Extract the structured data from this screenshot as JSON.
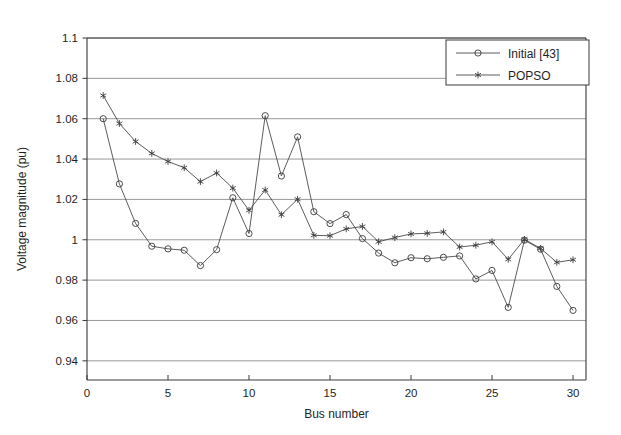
{
  "chart_data": {
    "type": "line",
    "title": "",
    "xlabel": "Bus number",
    "ylabel": "Voltage magnitude (pu)",
    "xlim": [
      0,
      30.8
    ],
    "ylim": [
      0.9305,
      1.1
    ],
    "xticks": [
      0,
      5,
      10,
      15,
      20,
      25,
      30
    ],
    "xticklabels": [
      "0",
      "5",
      "10",
      "15",
      "20",
      "25",
      "30"
    ],
    "yticks": [
      0.94,
      0.96,
      0.98,
      1.0,
      1.02,
      1.04,
      1.06,
      1.08,
      1.1
    ],
    "yticklabels": [
      "0.94",
      "0.96",
      "0.98",
      "1",
      "1.02",
      "1.04",
      "1.06",
      "1.08",
      "1.1"
    ],
    "grid": "horizontal",
    "legend_position": "top-right",
    "x": [
      1,
      2,
      3,
      4,
      5,
      6,
      7,
      8,
      9,
      10,
      11,
      12,
      13,
      14,
      15,
      16,
      17,
      18,
      19,
      20,
      21,
      22,
      23,
      24,
      25,
      26,
      27,
      28,
      29,
      30
    ],
    "series": [
      {
        "name": "Initial [43]",
        "marker": "circle",
        "color": "#3a3a3a",
        "values": [
          1.06,
          1.0277,
          1.0081,
          0.9968,
          0.9955,
          0.9948,
          0.9872,
          0.9951,
          1.0208,
          1.0031,
          1.0615,
          1.0316,
          1.051,
          1.0139,
          1.008,
          1.0125,
          1.0006,
          0.9934,
          0.9886,
          0.9911,
          0.9906,
          0.9913,
          0.992,
          0.9806,
          0.9848,
          0.9665,
          0.9998,
          0.9953,
          0.9769,
          0.965
        ]
      },
      {
        "name": "POPSO",
        "marker": "star",
        "color": "#3a3a3a",
        "values": [
          1.0715,
          1.0576,
          1.0487,
          1.0428,
          1.0388,
          1.0357,
          1.0288,
          1.0331,
          1.0256,
          1.0146,
          1.0247,
          1.0124,
          1.0201,
          1.0022,
          1.002,
          1.0054,
          1.0066,
          0.999,
          1.0011,
          1.0029,
          1.0032,
          1.0039,
          0.9964,
          0.9973,
          0.999,
          0.9903,
          1.0002,
          0.9957,
          0.9888,
          0.9901
        ]
      }
    ]
  },
  "legend": {
    "entries": [
      {
        "label": "Initial [43]",
        "marker": "circle-marker"
      },
      {
        "label": "POPSO",
        "marker": "star-marker"
      }
    ]
  },
  "axes": {
    "x_title": "Bus number",
    "y_title": "Voltage magnitude (pu)"
  }
}
